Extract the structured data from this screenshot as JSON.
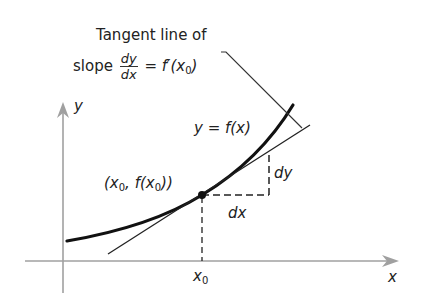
{
  "figure": {
    "title_line1": "Tangent line of",
    "title_line2_prefix": "slope",
    "slope_fraction": {
      "numerator": "dy",
      "denominator": "dx"
    },
    "title_line2_suffix_eq": "= f′(x",
    "title_line2_sub": "0",
    "title_line2_close": ")",
    "curve_label": "y = f(x)",
    "point_label_open": "(x",
    "point_label_sub1": "0",
    "point_label_mid": ", f(x",
    "point_label_sub2": "0",
    "point_label_close": "))",
    "dy_label": "dy",
    "dx_label": "dx",
    "x_axis_label": "x",
    "y_axis_label": "y",
    "x0_label": "x",
    "x0_sub": "0"
  },
  "colors": {
    "axis": "#a0a0a0",
    "curve": "#111111",
    "tangent": "#222222",
    "dashed": "#222222",
    "text": "#222222"
  }
}
